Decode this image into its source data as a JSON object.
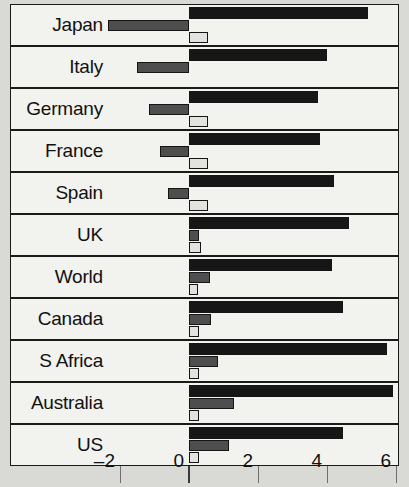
{
  "chart_data": {
    "type": "bar",
    "orientation": "horizontal",
    "title": "",
    "xlabel": "",
    "ylabel": "",
    "xlim": [
      -3,
      6.4
    ],
    "xticks": [
      -2,
      0,
      2,
      4,
      6
    ],
    "xtick_labels": [
      "–2",
      "0",
      "2",
      "4",
      "6"
    ],
    "grid": true,
    "legend": "none",
    "categories": [
      "Japan",
      "Italy",
      "Germany",
      "France",
      "Spain",
      "UK",
      "World",
      "Canada",
      "S Africa",
      "Australia",
      "US"
    ],
    "series": [
      {
        "name": "series-black",
        "color": "#161616",
        "values": [
          5.2,
          4.0,
          3.75,
          3.8,
          4.2,
          4.65,
          4.15,
          4.45,
          5.75,
          5.9,
          4.45
        ]
      },
      {
        "name": "series-gray",
        "color": "#4e4e4e",
        "values": [
          -2.35,
          -1.5,
          -1.15,
          -0.85,
          -0.6,
          0.3,
          0.6,
          0.65,
          0.85,
          1.3,
          1.15
        ]
      },
      {
        "name": "series-light",
        "color": "#e2e2de",
        "values": [
          0.55,
          0.0,
          0.55,
          0.55,
          0.55,
          0.35,
          0.25,
          0.3,
          0.3,
          0.3,
          0.3
        ]
      }
    ]
  },
  "colors": {
    "background": "#d9d9d6",
    "panel": "#f2f2ef",
    "grid": "#6e6e6e",
    "zero_line": "#3a3a3a",
    "text": "#111111"
  }
}
